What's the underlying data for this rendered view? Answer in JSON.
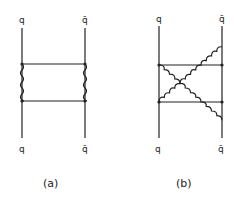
{
  "figure": {
    "panels": [
      {
        "id": "a",
        "caption": "(a)",
        "description": "box diagram: quark-antiquark ladder with two horizontal fermion rungs and two vertical wavy boson lines",
        "labels": {
          "top_left": "q",
          "top_right": "q̄",
          "bottom_left": "q",
          "bottom_right": "q̄"
        },
        "boson_lines": "straight"
      },
      {
        "id": "b",
        "caption": "(b)",
        "description": "crossed box diagram: two horizontal fermion rungs with crossed wavy boson lines",
        "labels": {
          "top_left": "q",
          "top_right": "q̄",
          "bottom_left": "q",
          "bottom_right": "q̄"
        },
        "boson_lines": "crossed"
      }
    ]
  },
  "colors": {
    "line": "#222222",
    "background": "#ffffff"
  }
}
